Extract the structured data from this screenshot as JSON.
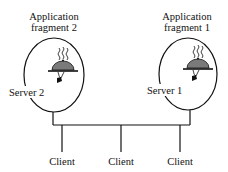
{
  "diagram": {
    "fragments": [
      {
        "label_line1": "Application",
        "label_line2": "fragment 2",
        "server": "Server 2"
      },
      {
        "label_line1": "Application",
        "label_line2": "fragment 1",
        "server": "Server 1"
      }
    ],
    "clients": [
      "Client",
      "Client",
      "Client"
    ],
    "icons": {
      "server": "covered-dish-on-tray-icon"
    },
    "colors": {
      "line": "#111111",
      "dome": "#7a7a7a"
    }
  }
}
